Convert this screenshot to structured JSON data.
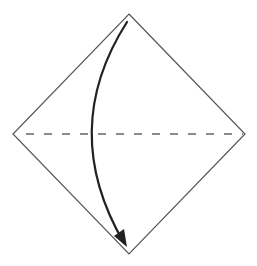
{
  "diagram": {
    "type": "origami-fold-instruction",
    "colors": {
      "background": "#ffffff",
      "paper_outline": "#555555",
      "fold_line": "#666666",
      "arrow": "#222222"
    },
    "paper": {
      "shape": "diamond",
      "vertices": {
        "top": [
          129,
          14
        ],
        "right": [
          245,
          134
        ],
        "bottom": [
          129,
          254
        ],
        "left": [
          13,
          134
        ]
      }
    },
    "fold_line": {
      "style": "dashed",
      "kind": "valley-fold",
      "from": [
        26,
        134
      ],
      "to": [
        243,
        134
      ],
      "dash": 8,
      "gap": 10
    },
    "arrow": {
      "kind": "fold-direction",
      "start": [
        127,
        22
      ],
      "control": [
        58,
        130
      ],
      "end": [
        124,
        243
      ],
      "head_tip": [
        127,
        247
      ],
      "direction": "top-to-bottom"
    }
  }
}
